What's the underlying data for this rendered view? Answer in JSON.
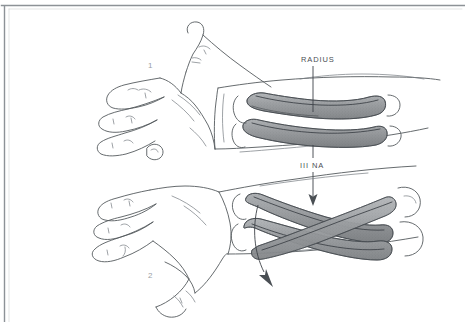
{
  "figure": {
    "background_color": "#ffffff",
    "ink_color": "#555a5e",
    "bone_fill_color": "#9b9ea1",
    "frame_color": "#8d9297",
    "width": 466,
    "height": 322
  },
  "labels": {
    "radius": "RADIUS",
    "ulna": "III NA",
    "position_one": "1",
    "position_two": "2"
  },
  "annotations": {
    "radius_leader": "leader-line from RADIUS label down to upper radius shaft",
    "ulna_leader": "leader-line from III NA label to upper ulna shaft",
    "rotation_arrow": "long vertical arrow indicating rotation from position 1 to position 2",
    "motion_arrow": "solid arrowhead pointing down-left showing direction of pronation"
  },
  "regions": {
    "upper_hand": "supinated hand with extended thumb, position 1",
    "lower_hand": "pronated hand, position 2",
    "upper_bones": "radius and ulna lying parallel",
    "lower_bones": "radius crossed over ulna"
  }
}
